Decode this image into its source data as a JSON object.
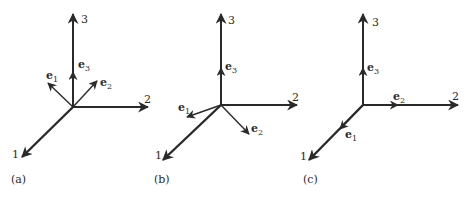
{
  "figure": {
    "panels": [
      {
        "caption": "(a)",
        "axes": {
          "axis1": "1",
          "axis2": "2",
          "axis3": "3"
        },
        "vectors": {
          "e1": {
            "base": "e",
            "sub": "1"
          },
          "e2": {
            "base": "e",
            "sub": "2"
          },
          "e3": {
            "base": "e",
            "sub": "3"
          }
        }
      },
      {
        "caption": "(b)",
        "axes": {
          "axis1": "1",
          "axis2": "2",
          "axis3": "3"
        },
        "vectors": {
          "e1": {
            "base": "e",
            "sub": "1"
          },
          "e2": {
            "base": "e",
            "sub": "2"
          },
          "e3": {
            "base": "e",
            "sub": "3"
          }
        }
      },
      {
        "caption": "(c)",
        "axes": {
          "axis1": "1",
          "axis2": "2",
          "axis3": "3"
        },
        "vectors": {
          "e1": {
            "base": "e",
            "sub": "1"
          },
          "e2": {
            "base": "e",
            "sub": "2"
          },
          "e3": {
            "base": "e",
            "sub": "3"
          }
        }
      }
    ],
    "colors": {
      "stroke": "#2a2a2a",
      "background": "#ffffff"
    }
  }
}
